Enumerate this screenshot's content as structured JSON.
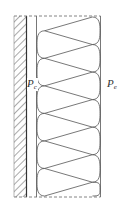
{
  "diagram": {
    "title": "",
    "labels": {
      "left": {
        "main": "P",
        "sub": "c"
      },
      "right": {
        "main": "P",
        "sub": "e"
      }
    },
    "components": [
      {
        "name": "masonry-wall",
        "style": "hatched"
      },
      {
        "name": "vapor-line",
        "style": "solid"
      },
      {
        "name": "batt-insulation",
        "style": "zigzag-loops",
        "loops": 13
      },
      {
        "name": "insulation-boundary",
        "style": "dashed"
      }
    ],
    "colors": {
      "stroke": "#555555",
      "background": "#ffffff"
    }
  }
}
